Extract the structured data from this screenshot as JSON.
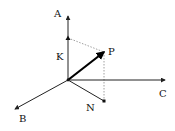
{
  "diagram": {
    "type": "3d-vector-projection",
    "colors": {
      "axis": "#222222",
      "vector": "#000000",
      "dashed": "#888888",
      "background": "#ffffff"
    },
    "origin": {
      "x": 68,
      "y": 80
    },
    "axes": [
      {
        "id": "A",
        "label": "A",
        "tip": {
          "x": 68,
          "y": 16
        },
        "label_pos": {
          "x": 54,
          "y": 17
        }
      },
      {
        "id": "B",
        "label": "B",
        "tip": {
          "x": 15,
          "y": 109
        },
        "label_pos": {
          "x": 19,
          "y": 122
        }
      },
      {
        "id": "C",
        "label": "C",
        "tip": {
          "x": 165,
          "y": 80
        },
        "label_pos": {
          "x": 159,
          "y": 97
        }
      }
    ],
    "vector": {
      "label": "P",
      "tip": {
        "x": 104,
        "y": 52
      },
      "label_pos": {
        "x": 108,
        "y": 55
      }
    },
    "projections": [
      {
        "id": "K",
        "label": "K",
        "point": {
          "x": 68,
          "y": 38
        },
        "label_pos": {
          "x": 56,
          "y": 60
        }
      },
      {
        "id": "N",
        "label": "N",
        "point": {
          "x": 104,
          "y": 101
        },
        "label_pos": {
          "x": 86,
          "y": 111
        }
      }
    ]
  }
}
